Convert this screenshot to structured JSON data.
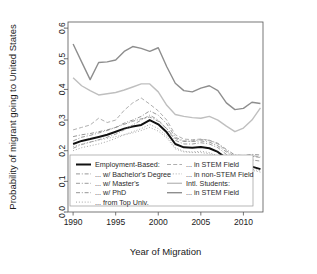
{
  "chart_data": {
    "type": "line",
    "title": "",
    "xlabel": "Year of Migration",
    "ylabel": "Probability of migrant going to United States",
    "xlim": [
      1989.4,
      2012.3
    ],
    "ylim": [
      0.0,
      0.62
    ],
    "grid": false,
    "legend_position": "bottom-inside",
    "xticks": [
      1990,
      1995,
      2000,
      2005,
      2010
    ],
    "xtick_labels": [
      "1990",
      "1995",
      "2000",
      "2005",
      "2010"
    ],
    "yticks": [
      0.0,
      0.1,
      0.2,
      0.3,
      0.4,
      0.5,
      0.6
    ],
    "ytick_labels": [
      "0.0",
      "0.1",
      "0.2",
      "0.3",
      "0.4",
      "0.5",
      "0.6"
    ],
    "x": [
      1990,
      1991,
      1992,
      1993,
      1994,
      1995,
      1996,
      1997,
      1998,
      1999,
      2000,
      2001,
      2002,
      2003,
      2004,
      2005,
      2006,
      2007,
      2008,
      2009,
      2010,
      2011,
      2012
    ],
    "series": [
      {
        "name": "Employment-Based:",
        "style": "solid",
        "color": "#111111",
        "width": 2.0,
        "values": [
          0.222,
          0.232,
          0.238,
          0.245,
          0.252,
          0.262,
          0.272,
          0.279,
          0.284,
          0.3,
          0.286,
          0.26,
          0.222,
          0.211,
          0.21,
          0.212,
          0.208,
          0.196,
          0.175,
          0.152,
          0.148,
          0.148,
          0.14
        ]
      },
      {
        "name": "... w/ Bachelor's Degree",
        "style": "dashdot",
        "color": "#8c8c8c",
        "width": 0.9,
        "values": [
          0.232,
          0.244,
          0.25,
          0.258,
          0.266,
          0.276,
          0.29,
          0.3,
          0.312,
          0.33,
          0.316,
          0.288,
          0.244,
          0.232,
          0.23,
          0.232,
          0.228,
          0.216,
          0.196,
          0.178,
          0.176,
          0.182,
          0.178
        ]
      },
      {
        "name": "... w/ Master's",
        "style": "dashdot",
        "color": "#909090",
        "width": 0.9,
        "values": [
          0.208,
          0.22,
          0.228,
          0.236,
          0.244,
          0.254,
          0.268,
          0.284,
          0.3,
          0.316,
          0.3,
          0.272,
          0.234,
          0.222,
          0.222,
          0.226,
          0.222,
          0.21,
          0.188,
          0.168,
          0.166,
          0.17,
          0.166
        ]
      },
      {
        "name": "... w/ PhD",
        "style": "dashdot",
        "color": "#8a8a8a",
        "width": 0.9,
        "values": [
          0.246,
          0.252,
          0.256,
          0.262,
          0.268,
          0.276,
          0.286,
          0.296,
          0.304,
          0.31,
          0.296,
          0.272,
          0.24,
          0.23,
          0.232,
          0.236,
          0.234,
          0.224,
          0.204,
          0.186,
          0.184,
          0.188,
          0.186
        ]
      },
      {
        "name": "... from Top Univ.",
        "style": "dotted",
        "color": "#9a9a9a",
        "width": 0.9,
        "values": [
          0.2,
          0.21,
          0.216,
          0.222,
          0.23,
          0.24,
          0.252,
          0.262,
          0.272,
          0.286,
          0.272,
          0.248,
          0.21,
          0.198,
          0.196,
          0.198,
          0.194,
          0.182,
          0.162,
          0.142,
          0.138,
          0.14,
          0.134
        ]
      },
      {
        "name": "... in STEM Field",
        "style": "dashed",
        "color": "#a6a6a6",
        "width": 0.9,
        "values": [
          0.268,
          0.276,
          0.284,
          0.306,
          0.292,
          0.3,
          0.332,
          0.356,
          0.372,
          0.352,
          0.33,
          0.3,
          0.252,
          0.238,
          0.236,
          0.238,
          0.234,
          0.222,
          0.2,
          0.18,
          0.178,
          0.184,
          0.18
        ]
      },
      {
        "name": "... in non-STEM Field",
        "style": "dotted",
        "color": "#a0a0a0",
        "width": 0.9,
        "values": [
          0.214,
          0.222,
          0.228,
          0.234,
          0.24,
          0.246,
          0.252,
          0.258,
          0.266,
          0.276,
          0.264,
          0.242,
          0.206,
          0.196,
          0.194,
          0.194,
          0.19,
          0.178,
          0.158,
          0.138,
          0.134,
          0.136,
          0.13
        ]
      },
      {
        "name": "Intl. Students:",
        "style": "solid",
        "color": "#bfbfbf",
        "width": 1.4,
        "values": [
          0.438,
          0.412,
          0.396,
          0.382,
          0.386,
          0.39,
          0.398,
          0.408,
          0.418,
          0.418,
          0.392,
          0.348,
          0.318,
          0.312,
          0.308,
          0.306,
          0.312,
          0.3,
          0.28,
          0.262,
          0.274,
          0.3,
          0.34
        ]
      },
      {
        "name": "... in STEM Field",
        "style": "solid",
        "color": "#8e8e8e",
        "width": 1.4,
        "values": [
          0.548,
          0.49,
          0.432,
          0.488,
          0.49,
          0.496,
          0.524,
          0.54,
          0.534,
          0.524,
          0.536,
          0.474,
          0.42,
          0.396,
          0.392,
          0.404,
          0.412,
          0.396,
          0.356,
          0.334,
          0.338,
          0.358,
          0.354
        ]
      }
    ]
  },
  "legend": {
    "columns": [
      {
        "entries": [
          {
            "label": "Employment-Based:",
            "style": "solid",
            "color": "#111111",
            "width": 2.0
          },
          {
            "label": "... w/ Bachelor's Degree",
            "style": "dashdot",
            "color": "#8c8c8c",
            "width": 0.9
          },
          {
            "label": "... w/ Master's",
            "style": "dashdot",
            "color": "#909090",
            "width": 0.9
          },
          {
            "label": "... w/ PhD",
            "style": "dashdot",
            "color": "#8a8a8a",
            "width": 0.9
          },
          {
            "label": "... from Top Univ.",
            "style": "dotted",
            "color": "#9a9a9a",
            "width": 0.9
          }
        ]
      },
      {
        "entries": [
          {
            "label": "... in STEM Field",
            "style": "dashed",
            "color": "#a6a6a6",
            "width": 0.9
          },
          {
            "label": "... in non-STEM Field",
            "style": "dotted",
            "color": "#a0a0a0",
            "width": 0.9
          },
          {
            "label": "Intl. Students:",
            "style": "solid",
            "color": "#bfbfbf",
            "width": 1.4
          },
          {
            "label": "... in STEM Field",
            "style": "solid",
            "color": "#8e8e8e",
            "width": 1.4
          }
        ]
      }
    ]
  }
}
